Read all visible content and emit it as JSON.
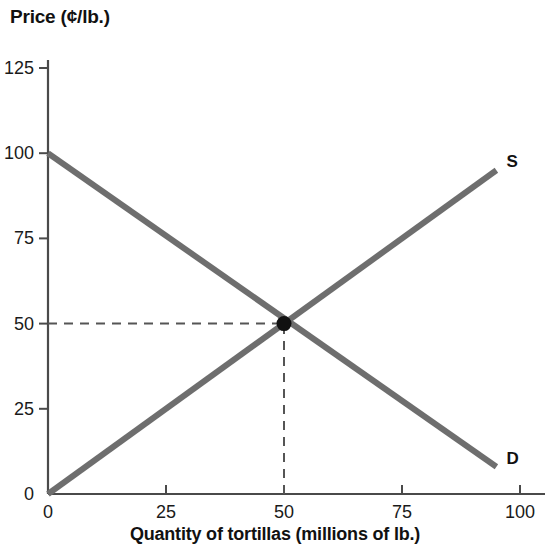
{
  "chart_data": {
    "type": "line",
    "title": "",
    "ylabel": "Price (¢/lb.)",
    "xlabel": "Quantity of tortillas (millions of lb.)",
    "xlim": [
      0,
      100
    ],
    "ylim": [
      0,
      125
    ],
    "grid": false,
    "legend": "inline-curve-labels",
    "x_ticks": [
      "0",
      "25",
      "50",
      "75",
      "100"
    ],
    "x_tick_values": [
      0,
      25,
      50,
      75,
      100
    ],
    "y_ticks": [
      "0",
      "25",
      "50",
      "75",
      "100",
      "125"
    ],
    "y_tick_values": [
      0,
      25,
      50,
      75,
      100,
      125
    ],
    "series": [
      {
        "name": "S",
        "label": "S",
        "description": "Supply curve",
        "color": "#6e6e6e",
        "x": [
          0,
          95
        ],
        "y": [
          0,
          95
        ]
      },
      {
        "name": "D",
        "label": "D",
        "description": "Demand curve",
        "color": "#6e6e6e",
        "x": [
          0,
          95
        ],
        "y": [
          100,
          8
        ]
      }
    ],
    "annotations": [
      {
        "name": "equilibrium-point",
        "type": "point",
        "x": 50,
        "y": 50,
        "color": "#111111"
      },
      {
        "name": "equilibrium-price-guide",
        "type": "dashed-line",
        "from": [
          0,
          50
        ],
        "to": [
          50,
          50
        ]
      },
      {
        "name": "equilibrium-quantity-guide",
        "type": "dashed-line",
        "from": [
          50,
          0
        ],
        "to": [
          50,
          50
        ]
      }
    ]
  },
  "labels": {
    "supply": "S",
    "demand": "D"
  },
  "colors": {
    "curve": "#6e6e6e",
    "axis": "#4a4a4a",
    "text": "#111111",
    "background": "#ffffff",
    "dashed": "#555555"
  }
}
